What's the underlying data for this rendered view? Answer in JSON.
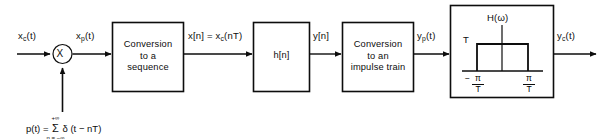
{
  "diagram": {
    "signals": {
      "input_continuous": "x",
      "input_continuous_sub": "c",
      "input_continuous_arg": "(t)",
      "modulated": "x",
      "modulated_sub": "p",
      "modulated_arg": "(t)",
      "sequence_label": "x[n]  =  x",
      "sequence_sub": "c",
      "sequence_arg": "(nT)",
      "filter_output": "y[n]",
      "impulse_train_out": "y",
      "impulse_train_out_sub": "p",
      "impulse_train_out_arg": "(t)",
      "reconstructed": "y",
      "reconstructed_sub": "c",
      "reconstructed_arg": "(t)"
    },
    "multiplier": {
      "symbol": "X",
      "name": "multiplier"
    },
    "blocks": [
      {
        "id": "conversion-to-sequence",
        "lines": [
          "Conversion",
          "to a",
          "sequence"
        ]
      },
      {
        "id": "discrete-filter",
        "lines": [
          "h[n]"
        ]
      },
      {
        "id": "conversion-to-impulse-train",
        "lines": [
          "Conversion",
          "to an",
          "impulse train"
        ]
      },
      {
        "id": "reconstruction-filter",
        "lines": []
      }
    ],
    "impulse_equation": {
      "lhs": "p(t)  =",
      "sigma": "Σ",
      "upper_limit": "+∞",
      "lower_limit": "n = −∞",
      "rhs": "δ (t − nT)"
    },
    "reconstruction_plot": {
      "curve_label": "H(ω)",
      "amplitude_label": "T",
      "left_tick": {
        "sign": "−",
        "numerator": "π",
        "denominator": "T"
      },
      "right_tick": {
        "sign": "",
        "numerator": "π",
        "denominator": "T"
      }
    },
    "colors": {
      "stroke": "#0d0d0d",
      "background": "#ffffff",
      "text": "#0d0d0d"
    }
  }
}
